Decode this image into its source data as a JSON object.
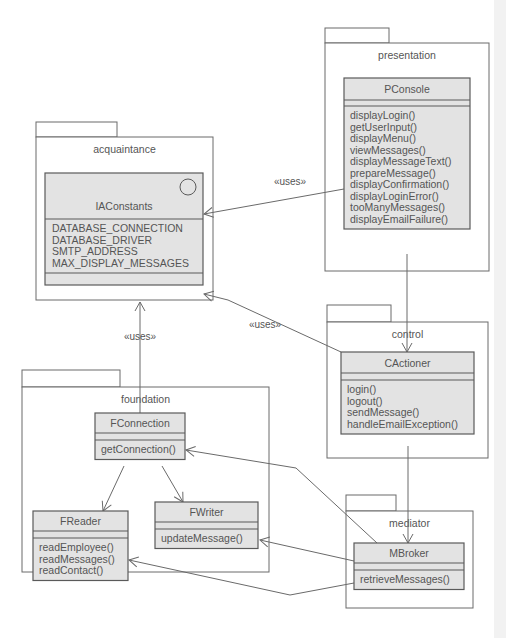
{
  "packages": [
    {
      "id": "presentation",
      "label": "presentation",
      "x": 325,
      "y": 43,
      "w": 164,
      "h": 228,
      "tabW": 64,
      "tabH": 15
    },
    {
      "id": "acquaintance",
      "label": "acquaintance",
      "x": 36,
      "y": 137,
      "w": 177,
      "h": 163,
      "tabW": 81,
      "tabH": 15
    },
    {
      "id": "control",
      "label": "control",
      "x": 327,
      "y": 322,
      "w": 161,
      "h": 136,
      "tabW": 64,
      "tabH": 17
    },
    {
      "id": "foundation",
      "label": "foundation",
      "x": 22,
      "y": 387,
      "w": 247,
      "h": 185,
      "tabW": 98,
      "tabH": 17
    },
    {
      "id": "mediator",
      "label": "mediator",
      "x": 346,
      "y": 511,
      "w": 127,
      "h": 97,
      "tabW": 50,
      "tabH": 16
    }
  ],
  "classes": [
    {
      "id": "PConsole",
      "name": "PConsole",
      "x": 344,
      "y": 78,
      "w": 126,
      "headH": 22,
      "attrH": 6,
      "attributes": [],
      "methods": [
        "displayLogin()",
        "getUserInput()",
        "displayMenu()",
        "viewMessages()",
        "displayMessageText()",
        "prepareMessage()",
        "displayConfirmation()",
        "displayLoginError()",
        "tooManyMessages()",
        "displayEmailFailure()"
      ]
    },
    {
      "id": "IAConstants",
      "name": "IAConstants",
      "x": 45,
      "y": 173,
      "w": 158,
      "headH": 46,
      "attrH": 0,
      "interface": true,
      "attributes": [
        "DATABASE_CONNECTION",
        "DATABASE_DRIVER",
        "SMTP_ADDRESS",
        "MAX_DISPLAY_MESSAGES"
      ],
      "methods": []
    },
    {
      "id": "CActioner",
      "name": "CActioner",
      "x": 341,
      "y": 352,
      "w": 133,
      "headH": 21,
      "attrH": 7,
      "attributes": [],
      "methods": [
        "login()",
        "logout()",
        "sendMessage()",
        "handleEmailException()"
      ]
    },
    {
      "id": "FConnection",
      "name": "FConnection",
      "x": 95,
      "y": 413,
      "w": 90,
      "headH": 20,
      "attrH": 7,
      "attributes": [],
      "methods": [
        "getConnection()"
      ]
    },
    {
      "id": "FReader",
      "name": "FReader",
      "x": 33,
      "y": 511,
      "w": 95,
      "headH": 20,
      "attrH": 7,
      "attributes": [],
      "methods": [
        "readEmployee()",
        "readMessages()",
        "readContact()"
      ]
    },
    {
      "id": "FWriter",
      "name": "FWriter",
      "x": 155,
      "y": 502,
      "w": 103,
      "headH": 20,
      "attrH": 7,
      "attributes": [],
      "methods": [
        "updateMessage()"
      ]
    },
    {
      "id": "MBroker",
      "name": "MBroker",
      "x": 354,
      "y": 543,
      "w": 110,
      "headH": 20,
      "attrH": 7,
      "attributes": [],
      "methods": [
        "retrieveMessages()"
      ]
    }
  ],
  "relations": [
    {
      "from": "PConsole",
      "to": "IAConstants",
      "label": "«uses»",
      "points": [
        [
          344,
          189
        ],
        [
          204,
          214
        ]
      ],
      "labelX": 290,
      "labelY": 185
    },
    {
      "from": "CActioner",
      "to": "IAConstants",
      "label": "«uses»",
      "points": [
        [
          341,
          352
        ],
        [
          228,
          300
        ],
        [
          204,
          294
        ]
      ],
      "labelX": 265,
      "labelY": 328
    },
    {
      "from": "FConnection",
      "to": "IAConstants",
      "label": "«uses»",
      "points": [
        [
          140,
          413
        ],
        [
          140,
          302
        ]
      ],
      "labelX": 140,
      "labelY": 340
    },
    {
      "from": "PConsole",
      "to": "CActioner",
      "label": "",
      "points": [
        [
          407,
          254
        ],
        [
          407,
          352
        ]
      ]
    },
    {
      "from": "CActioner",
      "to": "MBroker",
      "label": "",
      "points": [
        [
          408,
          446
        ],
        [
          408,
          543
        ]
      ]
    },
    {
      "from": "FConnection",
      "to": "FReader",
      "label": "",
      "points": [
        [
          124,
          466
        ],
        [
          103,
          511
        ]
      ]
    },
    {
      "from": "FConnection",
      "to": "FWriter",
      "label": "",
      "points": [
        [
          162,
          466
        ],
        [
          183,
          502
        ]
      ]
    },
    {
      "from": "MBroker",
      "to": "FConnection",
      "label": "",
      "points": [
        [
          377,
          543
        ],
        [
          296,
          468
        ],
        [
          186,
          450
        ]
      ]
    },
    {
      "from": "MBroker",
      "to": "FWriter",
      "label": "",
      "points": [
        [
          354,
          561
        ],
        [
          260,
          540
        ]
      ]
    },
    {
      "from": "MBroker",
      "to": "FReader",
      "label": "",
      "points": [
        [
          354,
          583
        ],
        [
          290,
          595
        ],
        [
          129,
          560
        ]
      ]
    }
  ],
  "style": {
    "lineHeight": 11.5,
    "fontSize": 10.5,
    "classFill": "#e3e3e3",
    "stroke": "#5a5a5a",
    "text": "#555555"
  }
}
